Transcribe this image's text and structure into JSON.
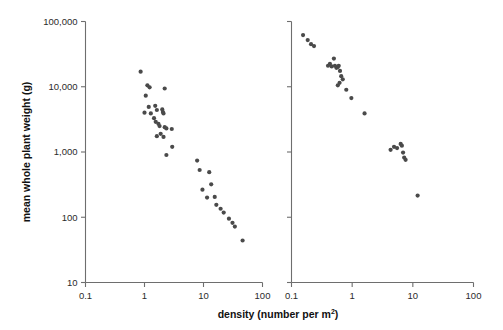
{
  "figure": {
    "background": "#ffffff",
    "point_color": "#4a4a4a",
    "axis_color": "#6e6e6e",
    "text_color": "#2b2b2b",
    "width": 503,
    "height": 330
  },
  "axis_titles": {
    "y": "mean whole plant weight (g)",
    "x_main": "density (number per m",
    "x_sup": "2",
    "x_tail": ")"
  },
  "y_ticks": [
    {
      "label": "100,000",
      "value": 100000
    },
    {
      "label": "10,000",
      "value": 10000
    },
    {
      "label": "1,000",
      "value": 1000
    },
    {
      "label": "100",
      "value": 100
    },
    {
      "label": "10",
      "value": 10
    }
  ],
  "x_ticks": [
    {
      "label": "0.1",
      "value": 0.1
    },
    {
      "label": "1",
      "value": 1
    },
    {
      "label": "10",
      "value": 10
    },
    {
      "label": "100",
      "value": 100
    }
  ],
  "chart_data": [
    {
      "type": "scatter",
      "panel": "left",
      "title": "",
      "xlabel": "density (number per m2)",
      "ylabel": "mean whole plant weight (g)",
      "xscale": "log",
      "yscale": "log",
      "xlim": [
        0.1,
        100
      ],
      "ylim": [
        10,
        100000
      ],
      "grid": false,
      "legend": "none",
      "x": [
        0.86,
        1.12,
        1.22,
        1.05,
        2.2,
        1.18,
        1.52,
        1.62,
        1.0,
        1.28,
        1.45,
        2.0,
        2.05,
        2.1,
        1.55,
        1.72,
        1.8,
        1.88,
        2.2,
        2.35,
        2.9,
        1.62,
        2.1,
        2.95,
        2.35,
        7.8,
        8.6,
        12.5,
        13.5,
        9.6,
        11.5,
        15.5,
        16.5,
        19.5,
        22.0,
        27.0,
        31.0,
        34.0,
        46.0
      ],
      "y": [
        17000,
        10500,
        9800,
        7300,
        9400,
        4900,
        5100,
        4400,
        4000,
        3900,
        3300,
        4500,
        4100,
        3900,
        2900,
        2700,
        2500,
        1900,
        2400,
        2300,
        2250,
        1750,
        1700,
        1200,
        900,
        740,
        530,
        490,
        320,
        265,
        200,
        205,
        155,
        135,
        118,
        95,
        82,
        72,
        44
      ]
    },
    {
      "type": "scatter",
      "panel": "right",
      "title": "",
      "xlabel": "density (number per m2)",
      "ylabel": "mean whole plant weight (g)",
      "xscale": "log",
      "yscale": "log",
      "xlim": [
        0.1,
        100
      ],
      "ylim": [
        10,
        100000
      ],
      "grid": false,
      "legend": "none",
      "x": [
        0.155,
        0.185,
        0.21,
        0.235,
        0.4,
        0.43,
        0.46,
        0.5,
        0.52,
        0.55,
        0.58,
        0.6,
        0.63,
        0.66,
        0.7,
        0.58,
        0.62,
        0.8,
        0.97,
        1.6,
        4.3,
        4.9,
        5.5,
        6.3,
        6.6,
        6.9,
        7.2,
        7.6,
        12.0
      ],
      "y": [
        62000,
        52000,
        45000,
        42000,
        21000,
        22500,
        20500,
        27000,
        21000,
        19500,
        20000,
        21000,
        17500,
        14500,
        13000,
        10500,
        11500,
        9000,
        6700,
        3900,
        1080,
        1200,
        1150,
        1330,
        1250,
        980,
        820,
        760,
        215
      ]
    }
  ]
}
